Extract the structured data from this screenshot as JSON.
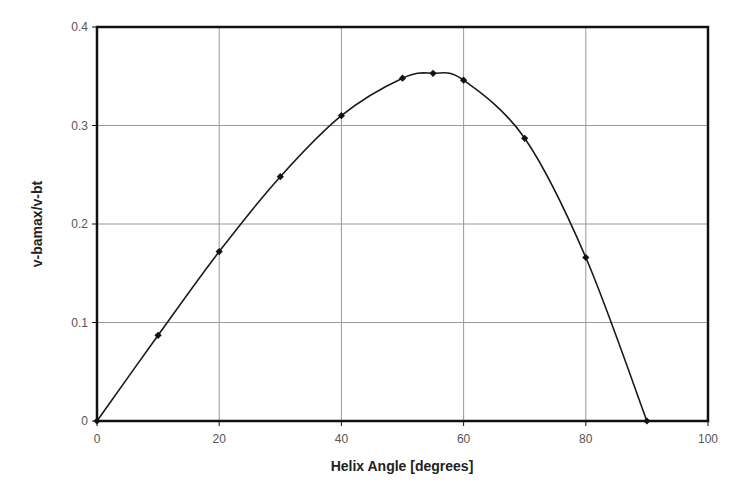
{
  "chart_data": {
    "type": "line",
    "title": "",
    "xlabel": "Helix Angle [degrees]",
    "ylabel": "v-bamax/v-bt",
    "xlim": [
      0,
      100
    ],
    "ylim": [
      0,
      0.4
    ],
    "x_ticks": [
      0,
      20,
      40,
      60,
      80,
      100
    ],
    "y_ticks": [
      0,
      0.1,
      0.2,
      0.3,
      0.4
    ],
    "x_tick_labels": [
      "0",
      "20",
      "40",
      "60",
      "80",
      "100"
    ],
    "y_tick_labels": [
      "0",
      "0.1",
      "0.2",
      "0.3",
      "0.4"
    ],
    "grid": true,
    "legend": null,
    "series": [
      {
        "name": "v-bamax/v-bt",
        "marker": "diamond",
        "smooth": true,
        "x": [
          0,
          10,
          20,
          30,
          40,
          50,
          55,
          60,
          70,
          80,
          90
        ],
        "y": [
          0,
          0.087,
          0.172,
          0.248,
          0.31,
          0.348,
          0.353,
          0.346,
          0.287,
          0.166,
          0
        ]
      }
    ]
  },
  "colors": {
    "line": "#1a1a1a",
    "grid": "#999999",
    "frame": "#111111"
  }
}
